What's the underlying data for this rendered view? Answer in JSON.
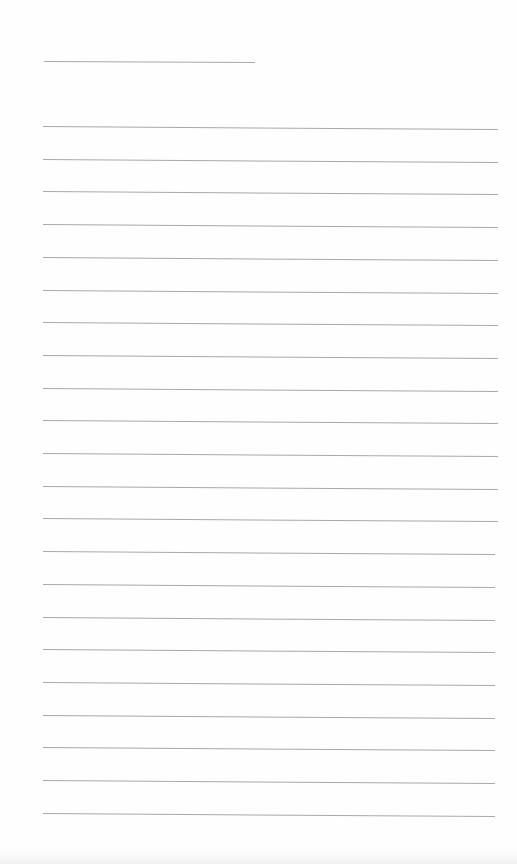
{
  "page": {
    "type": "blank lined paper",
    "background": "#fefefe",
    "rule_color": "#a9a9a9",
    "title_rule": {
      "x": 44,
      "y": 61,
      "width": 211
    },
    "lines": {
      "count": 22,
      "left": 43,
      "right": 498,
      "first_y": 126,
      "spacing": 32.7
    }
  }
}
